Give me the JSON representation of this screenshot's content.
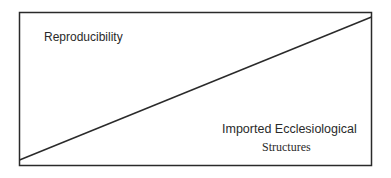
{
  "diagram": {
    "type": "tradeoff-box",
    "labels": {
      "top_left": "Reproducibility",
      "bottom_right_line1": "Imported Ecclesiological",
      "bottom_right_line2": "Structures"
    },
    "colors": {
      "stroke": "#2a2a2a",
      "background": "#ffffff"
    }
  }
}
